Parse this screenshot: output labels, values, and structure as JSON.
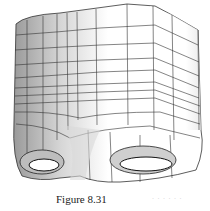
{
  "figure": {
    "caption": "Figure 8.31",
    "faint_text": "· · · · · ·",
    "colors": {
      "background": "#ffffff",
      "mesh_line": "#2a2a2a",
      "shade": "#c8c8c8"
    }
  }
}
